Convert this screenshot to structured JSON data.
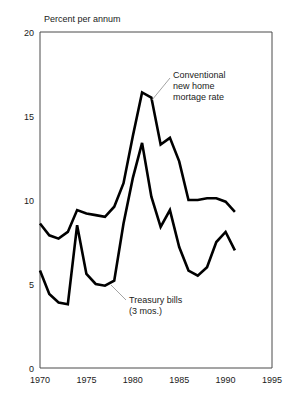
{
  "chart_data": {
    "type": "line",
    "title": "",
    "ylabel": "Percent per annum",
    "xlabel": "",
    "xlim": [
      1970,
      1995
    ],
    "ylim": [
      0,
      20
    ],
    "grid": false,
    "legend_position": "inline-annotations",
    "xticks": [
      "1970",
      "1975",
      "1980",
      "1985",
      "1990",
      "1995"
    ],
    "xtick_values": [
      1970,
      1975,
      1980,
      1985,
      1990,
      1995
    ],
    "yticks": [
      "0",
      "5",
      "10",
      "15",
      "20"
    ],
    "ytick_values": [
      0,
      5,
      10,
      15,
      20
    ],
    "x": [
      1970,
      1971,
      1972,
      1973,
      1974,
      1975,
      1976,
      1977,
      1978,
      1979,
      1980,
      1981,
      1982,
      1983,
      1984,
      1985,
      1986,
      1987,
      1988,
      1989,
      1990,
      1991
    ],
    "series": [
      {
        "name": "Conventional new home mortage rate",
        "values": [
          8.6,
          7.9,
          7.7,
          8.1,
          9.4,
          9.2,
          9.1,
          9.0,
          9.6,
          11.0,
          13.8,
          16.4,
          16.1,
          13.3,
          13.7,
          12.3,
          10.0,
          10.0,
          10.1,
          10.1,
          9.9,
          9.3
        ],
        "color": "#000000",
        "label_lines": [
          "Conventional",
          "new home",
          "mortage rate"
        ]
      },
      {
        "name": "Treasury bills (3 mos.)",
        "values": [
          5.8,
          4.4,
          3.9,
          3.8,
          8.5,
          5.6,
          5.0,
          4.9,
          5.2,
          8.6,
          11.3,
          13.4,
          10.2,
          8.4,
          9.4,
          7.2,
          5.8,
          5.5,
          6.0,
          7.5,
          8.1,
          7.0
        ],
        "color": "#000000",
        "label_lines": [
          "Treasury bills",
          "(3 mos.)"
        ]
      }
    ],
    "annotations": [
      {
        "id": "mortgage-annotation",
        "lines": [
          "Conventional",
          "new home",
          "mortage rate"
        ]
      },
      {
        "id": "tbill-annotation",
        "lines": [
          "Treasury bills",
          "(3 mos.)"
        ]
      }
    ]
  }
}
